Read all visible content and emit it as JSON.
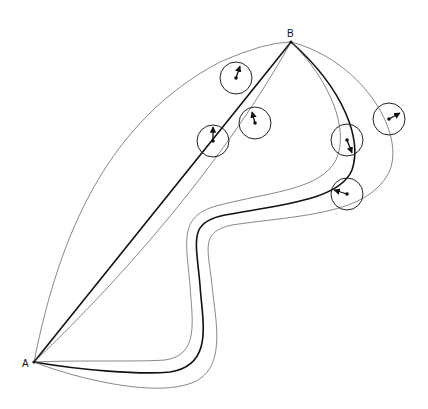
{
  "diagram": {
    "points": {
      "A": {
        "label": "A",
        "x": 34,
        "y": 362
      },
      "B": {
        "label": "B",
        "x": 291,
        "y": 42
      }
    },
    "paths": [
      {
        "id": "straight-line",
        "style": "thick",
        "d": "M34,362 L291,42"
      },
      {
        "id": "left-outer-envelope",
        "style": "thin",
        "d": "M34,362 C60,230 110,120 220,62 Q265,42 291,42"
      },
      {
        "id": "left-inner-envelope",
        "style": "thin",
        "d": "M34,362 C110,290 220,170 291,42"
      },
      {
        "id": "s-curve",
        "style": "thick",
        "d": "M34,362 C80,370 140,375 170,372 C215,365 202,320 200,285 C196,240 188,222 225,215 C280,205 340,200 352,170 C362,140 345,90 291,42"
      },
      {
        "id": "s-curve-inner",
        "style": "thin",
        "d": "M34,362 C80,360 140,362 165,360 C200,355 192,320 190,285 C186,240 178,215 220,205 C270,192 320,190 336,160 C350,130 330,80 291,42"
      },
      {
        "id": "s-curve-outer",
        "style": "thin",
        "d": "M34,362 C80,380 150,395 185,385 C230,375 215,320 212,285 C208,248 200,232 232,225 C300,215 370,215 390,170 C405,130 360,60 291,42"
      }
    ],
    "circles": [
      {
        "cx": 236,
        "cy": 78,
        "r": 16,
        "ax": 240,
        "ay": 66
      },
      {
        "cx": 213,
        "cy": 141,
        "r": 16,
        "ax": 213,
        "ay": 127
      },
      {
        "cx": 255,
        "cy": 123,
        "r": 16,
        "ax": 252,
        "ay": 112
      },
      {
        "cx": 347,
        "cy": 140,
        "r": 16,
        "ax": 352,
        "ay": 153
      },
      {
        "cx": 389,
        "cy": 119,
        "r": 16,
        "ax": 400,
        "ay": 113
      },
      {
        "cx": 347,
        "cy": 194,
        "r": 16,
        "ax": 334,
        "ay": 190
      }
    ]
  }
}
